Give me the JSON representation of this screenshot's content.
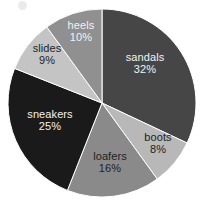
{
  "chart_data": {
    "type": "pie",
    "title": "",
    "subtitle": "",
    "xlabel": "",
    "ylabel": "",
    "legend_position": "none",
    "labels_inside_slices": true,
    "start_angle_clock": "12 o'clock",
    "direction": "clockwise",
    "total": 100,
    "units": "%",
    "categories": [
      "sandals",
      "boots",
      "loafers",
      "sneakers",
      "slides",
      "heels"
    ],
    "values": [
      32,
      8,
      16,
      25,
      9,
      10
    ],
    "slices": [
      {
        "label": "sandals",
        "value": 32,
        "value_text": "32%",
        "color": "#464646",
        "text_color": "#f2f2f2",
        "label_x": 145,
        "label_y": 63
      },
      {
        "label": "boots",
        "value": 8,
        "value_text": "8%",
        "color": "#b8b8b8",
        "text_color": "#1f1f1f",
        "label_x": 158,
        "label_y": 143
      },
      {
        "label": "loafers",
        "value": 16,
        "value_text": "16%",
        "color": "#8a8a8a",
        "text_color": "#1f1f1f",
        "label_x": 110,
        "label_y": 162
      },
      {
        "label": "sneakers",
        "value": 25,
        "value_text": "25%",
        "color": "#1a1a1a",
        "text_color": "#f2f2f2",
        "label_x": 50,
        "label_y": 120
      },
      {
        "label": "slides",
        "value": 9,
        "value_text": "9%",
        "color": "#c4c4c4",
        "text_color": "#1f1f1f",
        "label_x": 47,
        "label_y": 54
      },
      {
        "label": "heels",
        "value": 10,
        "value_text": "10%",
        "color": "#909090",
        "text_color": "#f2f2f2",
        "label_x": 81,
        "label_y": 31
      }
    ],
    "geometry": {
      "center_x": 102,
      "center_y": 103,
      "radius": 94
    },
    "background_color": "#ffffff"
  }
}
